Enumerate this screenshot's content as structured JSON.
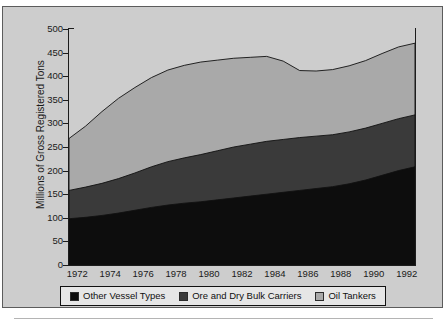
{
  "figure": {
    "background_color": "#cdcdcd",
    "page_color": "#ffffff",
    "border_color": "#5c5c5c"
  },
  "legend": {
    "position": "bottom-center",
    "items": [
      {
        "label": "Other Vessel Types",
        "color": "#0d0d0d",
        "swatch_name": "legend-swatch-other-vessel-types"
      },
      {
        "label": "Ore and Dry Bulk Carriers",
        "color": "#3a3a3a",
        "swatch_name": "legend-swatch-ore-and-dry-bulk-carriers"
      },
      {
        "label": "Oil Tankers",
        "color": "#a9a9a9",
        "swatch_name": "legend-swatch-oil-tankers"
      }
    ]
  },
  "caption": {
    "text": ""
  },
  "chart_data": {
    "type": "area",
    "stacked": true,
    "title": "",
    "subtitle": "",
    "xlabel": "",
    "ylabel": "Millions of Gross Registered Tons",
    "xlim": [
      1972,
      1993
    ],
    "ylim": [
      0,
      500
    ],
    "ytick_step": 50,
    "yticks": [
      0,
      50,
      100,
      150,
      200,
      250,
      300,
      350,
      400,
      450,
      500
    ],
    "xticks": [
      1972,
      1974,
      1976,
      1978,
      1980,
      1982,
      1984,
      1986,
      1988,
      1990,
      1992
    ],
    "xtick_labels": [
      "1972",
      "1974",
      "1976",
      "1978",
      "1980",
      "1982",
      "1984",
      "1986",
      "1988",
      "1990",
      "1992"
    ],
    "ytick_labels": [
      "0",
      "50",
      "100",
      "150",
      "200",
      "250",
      "300",
      "350",
      "400",
      "450",
      "500"
    ],
    "grid": false,
    "legend_position": "bottom",
    "x": [
      1972,
      1973,
      1974,
      1975,
      1976,
      1977,
      1978,
      1979,
      1980,
      1981,
      1982,
      1983,
      1984,
      1985,
      1986,
      1987,
      1988,
      1989,
      1990,
      1991,
      1992,
      1993
    ],
    "series": [
      {
        "name": "Other Vessel Types",
        "color": "#0d0d0d",
        "values": [
          98,
          101,
          105,
          110,
          116,
          122,
          127,
          131,
          134,
          138,
          142,
          146,
          150,
          154,
          158,
          162,
          166,
          172,
          180,
          190,
          200,
          208
        ]
      },
      {
        "name": "Ore and Dry Bulk Carriers",
        "color": "#3a3a3a",
        "values": [
          60,
          64,
          68,
          73,
          79,
          86,
          92,
          96,
          100,
          104,
          108,
          110,
          112,
          112,
          112,
          111,
          110,
          110,
          110,
          110,
          110,
          110
        ]
      },
      {
        "name": "Oil Tankers",
        "color": "#a9a9a9",
        "values": [
          110,
          129,
          152,
          170,
          181,
          189,
          194,
          196,
          196,
          192,
          188,
          184,
          180,
          166,
          142,
          138,
          138,
          140,
          143,
          148,
          152,
          152
        ]
      }
    ],
    "totals": [
      268,
      294,
      325,
      353,
      376,
      397,
      413,
      423,
      430,
      434,
      438,
      440,
      442,
      432,
      412,
      411,
      414,
      422,
      433,
      448,
      462,
      470
    ]
  }
}
